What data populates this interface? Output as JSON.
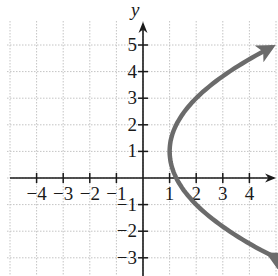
{
  "chart_data": {
    "type": "line",
    "title": "",
    "xlabel": "",
    "ylabel": "y",
    "xlim": [
      -5.1,
      4.9
    ],
    "ylim": [
      -3.7,
      5.9
    ],
    "grid": true,
    "x_ticks": [
      -4,
      -3,
      -2,
      -1,
      1,
      2,
      3,
      4
    ],
    "y_ticks": [
      -3,
      -2,
      -1,
      1,
      2,
      3,
      4,
      5
    ],
    "x_tick_labels": [
      "−4",
      "−3",
      "−2",
      "−1",
      "1",
      "2",
      "3",
      "4"
    ],
    "y_tick_labels": [
      "−3",
      "−2",
      "−1",
      "1",
      "2",
      "3",
      "4",
      "5"
    ],
    "series": [
      {
        "name": "parabola",
        "equation": "x = (1/4)(y - 1)^2 + 1",
        "vertex": [
          1,
          1
        ],
        "opens": "right",
        "arrows_at_ends": true,
        "points": [
          [
            4.9,
            -2.9
          ],
          [
            4,
            -2.46
          ],
          [
            3,
            -1.83
          ],
          [
            2,
            -1
          ],
          [
            1.25,
            0
          ],
          [
            1,
            1
          ],
          [
            1.25,
            2
          ],
          [
            2,
            3
          ],
          [
            3,
            3.83
          ],
          [
            4,
            4.46
          ],
          [
            4.9,
            4.9
          ]
        ],
        "color": "#6b6b6b"
      }
    ]
  },
  "colors": {
    "axis": "#1a1a1a",
    "grid": "#c4c4c4",
    "curve": "#6b6b6b"
  }
}
